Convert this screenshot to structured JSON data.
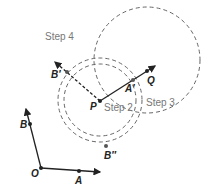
{
  "diagram": {
    "steps": [
      "Step 4",
      "Step 2",
      "Step 3"
    ],
    "points": {
      "O": "O",
      "A": "A",
      "B": "B",
      "P": "P",
      "Q": "Q",
      "A_prime": "A′",
      "B_prime": "B′",
      "B_double_prime": "B″"
    },
    "colors": {
      "line": "#222222",
      "dashed": "#666666",
      "label": "#777777"
    }
  }
}
